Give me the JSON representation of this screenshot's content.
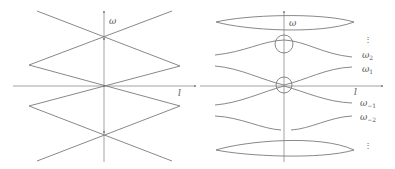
{
  "figure": {
    "left_panel": {
      "x_axis_label": "l",
      "y_axis_label": "ω",
      "description": "Unperturbed free dispersion: straight lines crossing at ω axis (band folding, no gaps)"
    },
    "right_panel": {
      "x_axis_label": "l",
      "y_axis_label": "ω",
      "band_labels": [
        {
          "base": "ω",
          "sub": "2"
        },
        {
          "base": "ω",
          "sub": "1"
        },
        {
          "base": "ω",
          "sub": "−1"
        },
        {
          "base": "ω",
          "sub": "−2"
        }
      ],
      "ellipsis_top": "⋮",
      "ellipsis_bottom": "⋮",
      "circles": 2,
      "description": "Perturbed dispersion with avoided crossings (gaps opened at circled points)"
    },
    "colors": {
      "line": "#7a7a7a",
      "axis": "#8a8a8a",
      "text": "#555555"
    }
  }
}
